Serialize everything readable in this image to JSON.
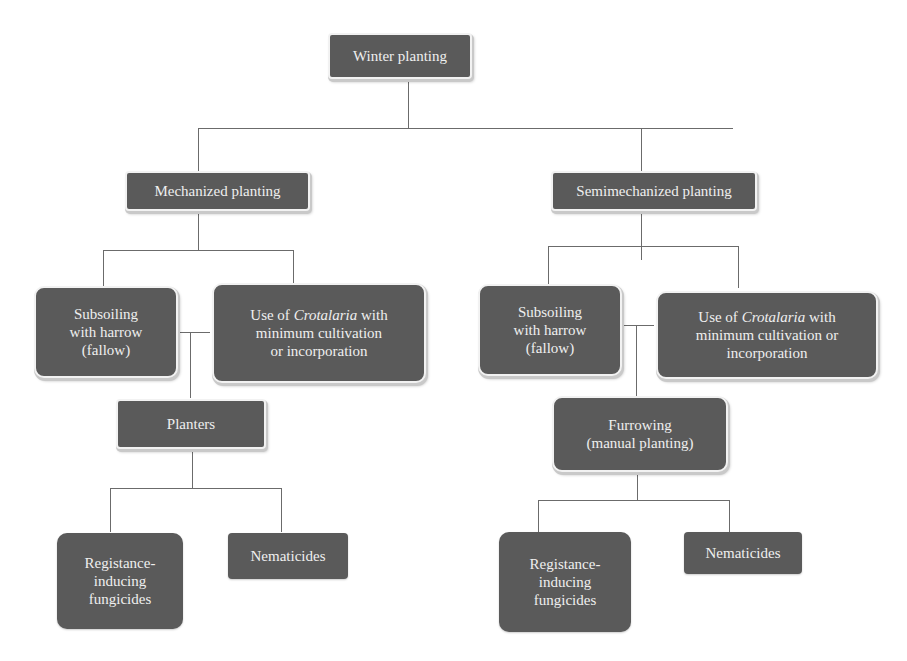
{
  "diagram": {
    "type": "tree",
    "background": "#ffffff",
    "node_fill": "#5a5a5a",
    "node_text_color": "#efefef",
    "connector_color": "#6b6b6b",
    "root": {
      "label": "Winter planting"
    },
    "branches": {
      "mechanized": {
        "label": "Mechanized planting",
        "subsoiling": "Subsoiling\nwith harrow\n(fallow)",
        "crotalaria": {
          "prefix": "Use of ",
          "italic": "Crotalaria",
          "suffix": " with\nminimum cultivation\nor incorporation"
        },
        "next": "Planters",
        "leaf_fungicides": "Registance-\ninducing\nfungicides",
        "leaf_nematicides": "Nematicides"
      },
      "semimechanized": {
        "label": "Semimechanized planting",
        "subsoiling": "Subsoiling\nwith harrow\n(fallow)",
        "crotalaria": {
          "prefix": "Use of ",
          "italic": "Crotalaria",
          "suffix": " with\nminimum cultivation or\nincorporation"
        },
        "next": "Furrowing\n(manual planting)",
        "leaf_fungicides": "Registance-\ninducing\nfungicides",
        "leaf_nematicides": "Nematicides"
      }
    }
  }
}
